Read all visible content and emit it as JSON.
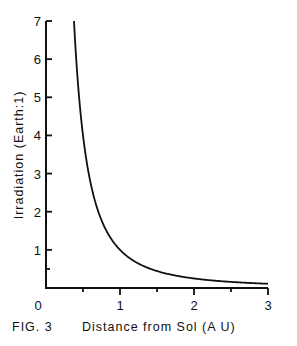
{
  "chart_data": {
    "type": "line",
    "title": "",
    "caption": "FIG. 3",
    "xlabel": "Distance from Sol (A U)",
    "ylabel": "Irradiation (Earth:1)",
    "xlim": [
      0,
      3
    ],
    "ylim": [
      0,
      7
    ],
    "x_ticks": [
      0,
      0.5,
      1,
      1.5,
      2,
      2.5,
      3
    ],
    "x_tick_labels": [
      "0",
      "",
      "1",
      "",
      "2",
      "",
      "3"
    ],
    "y_ticks": [
      0.5,
      1,
      2,
      3,
      4,
      5,
      6,
      7
    ],
    "y_tick_labels": [
      "",
      "1",
      "2",
      "3",
      "4",
      "5",
      "6",
      "7"
    ],
    "grid": false,
    "series": [
      {
        "name": "Irradiation = 1/d²",
        "formula": "1/x^2",
        "x": [
          0.378,
          0.4,
          0.45,
          0.5,
          0.6,
          0.7,
          0.8,
          0.9,
          1.0,
          1.2,
          1.4,
          1.6,
          1.8,
          2.0,
          2.25,
          2.5,
          2.75,
          3.0
        ],
        "y": [
          7.0,
          6.25,
          4.94,
          4.0,
          2.78,
          2.04,
          1.56,
          1.23,
          1.0,
          0.69,
          0.51,
          0.39,
          0.31,
          0.25,
          0.2,
          0.16,
          0.13,
          0.11
        ]
      }
    ]
  }
}
